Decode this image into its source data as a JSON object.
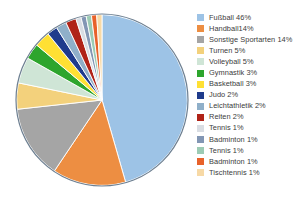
{
  "chart_data": {
    "type": "pie",
    "title": "",
    "subtitle": "",
    "xlabel": "",
    "ylabel": "",
    "legend_position": "right",
    "grid": false,
    "start_angle_deg": 0,
    "direction": "clockwise",
    "categories": [
      "Fußball",
      "Handball",
      "Sonstige Sportarten",
      "Turnen",
      "Volleyball",
      "Gymnastik",
      "Basketball",
      "Judo",
      "Leichtathletik",
      "Reiten",
      "Tennis",
      "Badminton",
      "Tennis",
      "Badminton",
      "Tischtennis"
    ],
    "values": [
      46,
      14,
      14,
      5,
      5,
      3,
      3,
      2,
      2,
      2,
      1,
      1,
      1,
      1,
      1
    ],
    "value_unit": "%",
    "colors": [
      "#9DC3E6",
      "#ED8E42",
      "#A5A5A5",
      "#F3D17C",
      "#CFE5D6",
      "#2DA52D",
      "#FFE033",
      "#1F3B8C",
      "#8FAFC9",
      "#B02318",
      "#D9DDE3",
      "#8296B4",
      "#9CCBB4",
      "#E8622A",
      "#F7D9A6"
    ],
    "slice_border_color": "#ffffff",
    "pie_outline_color": "#6d7f91",
    "legend_entries": [
      {
        "label": "Fußball 46%",
        "color": "#9DC3E6"
      },
      {
        "label": "Handball14%",
        "color": "#ED8E42"
      },
      {
        "label": "Sonstige Sportarten 14%",
        "color": "#A5A5A5"
      },
      {
        "label": "Turnen 5%",
        "color": "#F3D17C"
      },
      {
        "label": "Volleyball 5%",
        "color": "#CFE5D6"
      },
      {
        "label": "Gymnastik 3%",
        "color": "#2DA52D"
      },
      {
        "label": "Basketball 3%",
        "color": "#FFE033"
      },
      {
        "label": "Judo 2%",
        "color": "#1F3B8C"
      },
      {
        "label": "Leichtathletik 2%",
        "color": "#8FAFC9"
      },
      {
        "label": "Reiten 2%",
        "color": "#B02318"
      },
      {
        "label": "Tennis 1%",
        "color": "#D9DDE3"
      },
      {
        "label": "Badminton 1%",
        "color": "#8296B4"
      },
      {
        "label": "Tennis 1%",
        "color": "#9CCBB4"
      },
      {
        "label": "Badminton 1%",
        "color": "#E8622A"
      },
      {
        "label": "Tischtennis 1%",
        "color": "#F7D9A6"
      }
    ]
  }
}
